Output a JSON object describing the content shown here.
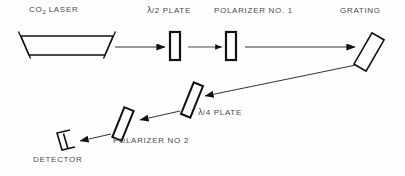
{
  "figure": {
    "kind": "optical-beam-path-diagram",
    "background_color": "#fefefe",
    "line_color": "#111111",
    "label_color": "#4a4a4a"
  },
  "labels": {
    "laser_pre": "CO",
    "laser_sub": "2",
    "laser_post": " LASER",
    "half_wave_plate": "/2 PLATE",
    "quarter_wave_plate": "/4 PLATE",
    "lambda": "λ",
    "polarizer_1": "POLARIZER NO. 1",
    "polarizer_2": "POLARIZER NO 2",
    "grating": "GRATING",
    "detector": "DETECTOR"
  },
  "components": [
    {
      "name": "co2-laser",
      "shape": "trapezoid-cavity",
      "label": "CO2 LASER"
    },
    {
      "name": "half-wave-plate",
      "shape": "upright-rectangle",
      "label": "λ/2 PLATE"
    },
    {
      "name": "polarizer-1",
      "shape": "upright-rectangle",
      "label": "POLARIZER NO. 1"
    },
    {
      "name": "grating",
      "shape": "tilted-rectangle",
      "label": "GRATING",
      "tilt_deg": 30
    },
    {
      "name": "quarter-wave-plate",
      "shape": "tilted-rectangle",
      "label": "λ/4 PLATE",
      "tilt_deg": 22
    },
    {
      "name": "polarizer-2",
      "shape": "tilted-rectangle",
      "label": "POLARIZER NO 2",
      "tilt_deg": 22
    },
    {
      "name": "detector",
      "shape": "bracket-c",
      "label": "DETECTOR"
    }
  ],
  "beams": [
    {
      "name": "laser-to-half-wave-plate",
      "from": "co2-laser",
      "to": "half-wave-plate",
      "direction": "right"
    },
    {
      "name": "half-wave-plate-to-polarizer-1",
      "from": "half-wave-plate",
      "to": "polarizer-1",
      "direction": "right"
    },
    {
      "name": "polarizer-1-to-grating",
      "from": "polarizer-1",
      "to": "grating",
      "direction": "right"
    },
    {
      "name": "grating-to-quarter-wave-plate",
      "from": "grating",
      "to": "quarter-wave-plate",
      "direction": "down-left"
    },
    {
      "name": "quarter-wave-plate-to-polarizer-2",
      "from": "quarter-wave-plate",
      "to": "polarizer-2",
      "direction": "down-left"
    },
    {
      "name": "polarizer-2-to-detector",
      "from": "polarizer-2",
      "to": "detector",
      "direction": "down-left"
    }
  ]
}
